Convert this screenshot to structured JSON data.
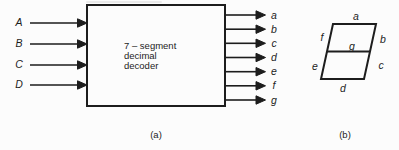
{
  "colors": {
    "ink": "#1d1d1d",
    "background": "#fcfcfc"
  },
  "decoder": {
    "inputs": [
      "A",
      "B",
      "C",
      "D"
    ],
    "outputs": [
      "a",
      "b",
      "c",
      "d",
      "e",
      "f",
      "g"
    ],
    "label_line1": "7 – segment",
    "label_line2": "decimal",
    "label_line3": "decoder"
  },
  "display": {
    "segments": {
      "a": "a",
      "b": "b",
      "c": "c",
      "d": "d",
      "e": "e",
      "f": "f",
      "g": "g"
    }
  },
  "captions": {
    "decoder": "(a)",
    "display": "(b)"
  }
}
